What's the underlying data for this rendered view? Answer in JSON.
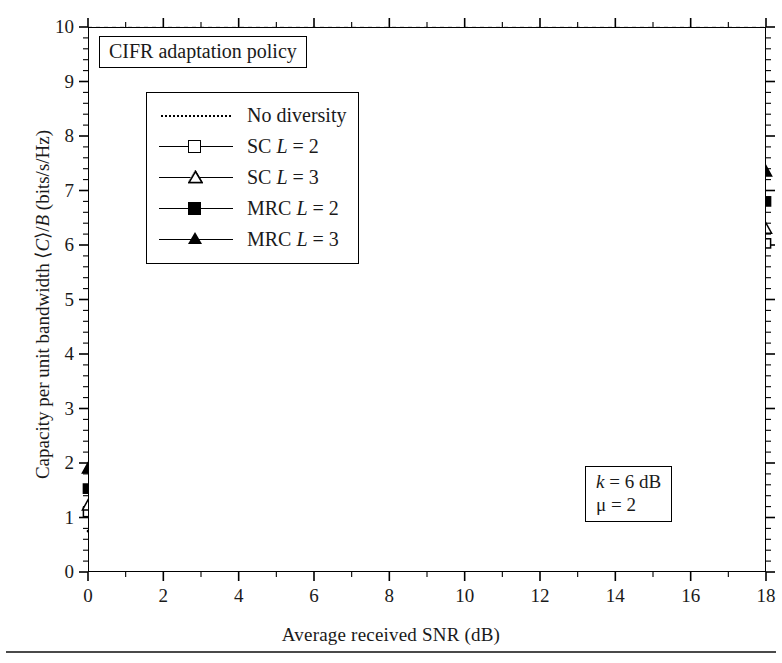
{
  "figure": {
    "policy_title": "CIFR adaptation policy",
    "xlabel": "Average received SNR (dB)",
    "ylabel_pre": "Capacity per unit bandwidth ⟨",
    "ylabel_c": "C",
    "ylabel_mid": "⟩/",
    "ylabel_b": "B",
    "ylabel_post": " (bits/s/Hz)"
  },
  "legend": {
    "entries": [
      {
        "label_main": "No diversity",
        "label_l": "",
        "label_val": "",
        "style": "dotted",
        "marker": "none"
      },
      {
        "label_main": "SC ",
        "label_l": "L",
        "label_val": " = 2",
        "style": "solid",
        "marker": "open-square"
      },
      {
        "label_main": "SC ",
        "label_l": "L",
        "label_val": " = 3",
        "style": "solid",
        "marker": "open-triangle"
      },
      {
        "label_main": "MRC ",
        "label_l": "L",
        "label_val": " = 2",
        "style": "solid",
        "marker": "filled-square"
      },
      {
        "label_main": "MRC ",
        "label_l": "L",
        "label_val": " = 3",
        "style": "solid",
        "marker": "filled-triangle"
      }
    ]
  },
  "params": {
    "line1_sym": "k",
    "line1_val": " = 6 dB",
    "line2_sym": "μ",
    "line2_val": " = 2"
  },
  "axes": {
    "yticks": [
      "0",
      "1",
      "2",
      "3",
      "4",
      "5",
      "6",
      "7",
      "8",
      "9",
      "10"
    ],
    "xticks": [
      "0",
      "2",
      "4",
      "6",
      "8",
      "10",
      "12",
      "14",
      "16",
      "18"
    ]
  },
  "chart_data": {
    "type": "line",
    "title": "CIFR adaptation policy",
    "xlabel": "Average received SNR (dB)",
    "ylabel": "Capacity per unit bandwidth <C>/B (bits/s/Hz)",
    "xlim": [
      0,
      18
    ],
    "ylim": [
      0,
      10
    ],
    "xticks": [
      0,
      2,
      4,
      6,
      8,
      10,
      12,
      14,
      16,
      18
    ],
    "yticks": [
      0,
      1,
      2,
      3,
      4,
      5,
      6,
      7,
      8,
      9,
      10
    ],
    "grid": "dashed-major",
    "legend_position": "upper-left",
    "annotations": [
      "k = 6 dB",
      "μ = 2"
    ],
    "x": [
      0,
      2,
      4,
      6,
      8,
      10,
      12,
      14,
      16,
      18
    ],
    "series": [
      {
        "name": "No diversity",
        "style": "dotted",
        "marker": "none",
        "values": [
          0.75,
          1.05,
          1.42,
          1.85,
          2.33,
          2.85,
          3.42,
          4.03,
          4.67,
          5.35
        ]
      },
      {
        "name": "SC L = 2",
        "style": "solid",
        "marker": "open-square",
        "values": [
          1.1,
          1.45,
          1.88,
          2.38,
          2.93,
          3.52,
          4.14,
          4.78,
          5.43,
          6.03
        ]
      },
      {
        "name": "SC L = 3",
        "style": "solid",
        "marker": "open-triangle",
        "values": [
          1.22,
          1.62,
          2.07,
          2.58,
          3.15,
          3.75,
          4.38,
          5.02,
          5.67,
          6.3
        ]
      },
      {
        "name": "MRC L = 2",
        "style": "solid",
        "marker": "filled-square",
        "values": [
          1.53,
          2.0,
          2.52,
          3.05,
          3.63,
          4.25,
          4.88,
          5.52,
          6.18,
          6.8
        ]
      },
      {
        "name": "MRC L = 3",
        "style": "solid",
        "marker": "filled-triangle",
        "values": [
          1.9,
          2.4,
          2.95,
          3.55,
          4.16,
          4.78,
          5.43,
          6.08,
          6.72,
          7.35
        ]
      }
    ]
  }
}
